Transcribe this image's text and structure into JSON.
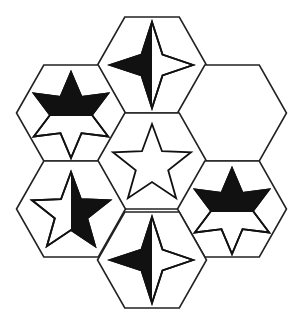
{
  "puzzle": {
    "title": "Hexagon star pattern puzzle",
    "colors": {
      "background": "#ffffff",
      "line": "#222222",
      "fill": "#111111"
    },
    "hex_radius": 54.5,
    "hex_half_height": 48,
    "cells": [
      {
        "id": "top",
        "cx": 152,
        "cy": 65,
        "shape": "star-4",
        "filled_half": "left",
        "label": "4-point star, left half black"
      },
      {
        "id": "upper-left",
        "cx": 71,
        "cy": 113,
        "shape": "star-6",
        "filled_half": "top",
        "label": "6-point star, top half black"
      },
      {
        "id": "upper-right",
        "cx": 232,
        "cy": 113,
        "shape": "empty",
        "filled_half": "none",
        "label": "empty (missing piece)"
      },
      {
        "id": "center",
        "cx": 152,
        "cy": 161,
        "shape": "star-5",
        "filled_half": "none",
        "label": "5-point star, all white"
      },
      {
        "id": "lower-left",
        "cx": 71,
        "cy": 209,
        "shape": "star-5",
        "filled_half": "right",
        "label": "5-point star, right half black"
      },
      {
        "id": "lower-right",
        "cx": 232,
        "cy": 209,
        "shape": "star-6",
        "filled_half": "top",
        "label": "6-point star, top half black"
      },
      {
        "id": "bottom",
        "cx": 152,
        "cy": 260,
        "shape": "star-4",
        "filled_half": "left",
        "label": "4-point star, left half black"
      }
    ]
  }
}
